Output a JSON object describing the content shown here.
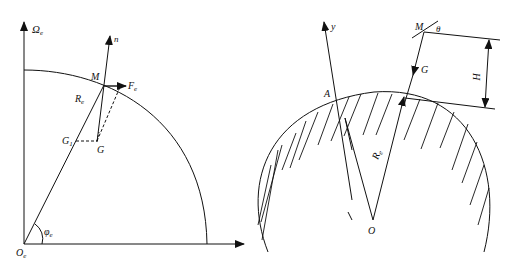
{
  "left_figure": {
    "labels": {
      "omega": "Ω",
      "omega_sub": "e",
      "n": "n",
      "M": "M",
      "F": "F",
      "F_sub": "e",
      "R": "R",
      "R_sub": "e",
      "G1": "G",
      "G1_sub": "1",
      "G": "G",
      "phi": "φ",
      "phi_sub": "e",
      "O": "O",
      "O_sub": "e"
    }
  },
  "right_figure": {
    "labels": {
      "y": "y",
      "M": "M",
      "theta": "θ",
      "G": "G",
      "H": "H",
      "A": "A",
      "R": "R",
      "R_sub": "e",
      "O": "O"
    }
  },
  "colors": {
    "line": "#111111",
    "background": "#ffffff"
  }
}
